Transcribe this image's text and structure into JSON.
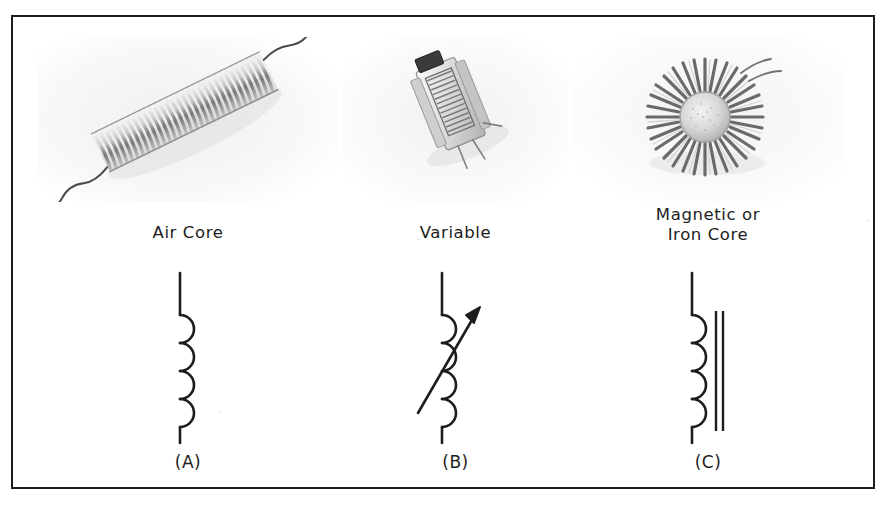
{
  "figure": {
    "background_color": "#ffffff",
    "frame_color": "#1a1a1a",
    "ink_color": "#1d1d1d"
  },
  "panels": [
    {
      "id": "a",
      "photo_name": "air-core-coil-photo",
      "photo_alt": "Helical air core coil with wire leads",
      "caption_lines": [
        "Air Core"
      ],
      "symbol_name": "air-core-inductor-symbol",
      "symbol_description": "Vertical lead with four semicircular coil loops",
      "coil_loops": 4,
      "has_core_bars": false,
      "has_arrow": false,
      "ref_label": "(A)"
    },
    {
      "id": "b",
      "photo_name": "variable-inductor-photo",
      "photo_alt": "Small rectangular variable inductor can with adjustment slug",
      "caption_lines": [
        "Variable"
      ],
      "symbol_name": "variable-inductor-symbol",
      "symbol_description": "Coil symbol crossed by a diagonal arrow pointing up-right",
      "coil_loops": 4,
      "has_core_bars": false,
      "has_arrow": true,
      "ref_label": "(B)"
    },
    {
      "id": "c",
      "photo_name": "toroid-iron-core-coil-photo",
      "photo_alt": "Toroidal iron core coil wound with wire",
      "caption_lines": [
        "Magnetic or",
        "Iron Core"
      ],
      "symbol_name": "iron-core-inductor-symbol",
      "symbol_description": "Coil symbol with two parallel vertical core bars alongside",
      "coil_loops": 4,
      "has_core_bars": true,
      "core_bar_count": 2,
      "has_arrow": false,
      "ref_label": "(C)"
    }
  ],
  "artifacts": {
    "speckle_1": "·",
    "speckle_2": "·",
    "speckle_3": "·"
  }
}
